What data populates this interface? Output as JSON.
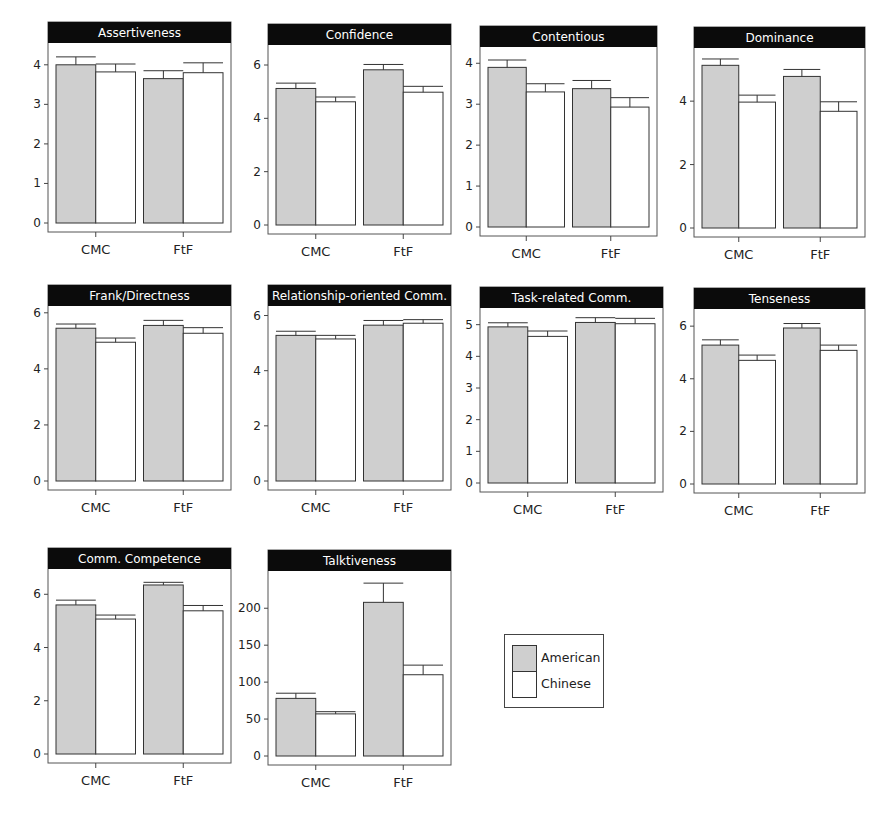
{
  "legend": {
    "items": [
      {
        "label": "American",
        "color": "#cfcfcf"
      },
      {
        "label": "Chinese",
        "color": "#ffffff"
      }
    ]
  },
  "chart_data": [
    {
      "type": "bar",
      "title": "Assertiveness",
      "categories": [
        "CMC",
        "FtF"
      ],
      "yticks": [
        0,
        1,
        2,
        3,
        4
      ],
      "ylim": [
        0,
        4.45
      ],
      "series": [
        {
          "name": "American",
          "values": [
            4.0,
            3.65
          ],
          "errors": [
            0.2,
            0.2
          ]
        },
        {
          "name": "Chinese",
          "values": [
            3.82,
            3.8
          ],
          "errors": [
            0.2,
            0.25
          ]
        }
      ],
      "box": {
        "left": 30,
        "top": 22,
        "width": 202,
        "height": 245
      }
    },
    {
      "type": "bar",
      "title": "Confidence",
      "categories": [
        "CMC",
        "FtF"
      ],
      "yticks": [
        0,
        2,
        4,
        6
      ],
      "ylim": [
        0,
        6.6
      ],
      "series": [
        {
          "name": "American",
          "values": [
            5.12,
            5.82
          ],
          "errors": [
            0.2,
            0.2
          ]
        },
        {
          "name": "Chinese",
          "values": [
            4.62,
            4.98
          ],
          "errors": [
            0.18,
            0.22
          ]
        }
      ],
      "box": {
        "left": 250,
        "top": 24,
        "width": 202,
        "height": 245
      }
    },
    {
      "type": "bar",
      "title": "Contentious",
      "categories": [
        "CMC",
        "FtF"
      ],
      "yticks": [
        0,
        1,
        2,
        3,
        4
      ],
      "ylim": [
        0,
        4.3
      ],
      "series": [
        {
          "name": "American",
          "values": [
            3.9,
            3.38
          ],
          "errors": [
            0.18,
            0.2
          ]
        },
        {
          "name": "Chinese",
          "values": [
            3.3,
            2.93
          ],
          "errors": [
            0.2,
            0.23
          ]
        }
      ],
      "box": {
        "left": 462,
        "top": 26,
        "width": 196,
        "height": 245
      }
    },
    {
      "type": "bar",
      "title": "Dominance",
      "categories": [
        "CMC",
        "FtF"
      ],
      "yticks": [
        0,
        2,
        4
      ],
      "ylim": [
        0,
        5.55
      ],
      "series": [
        {
          "name": "American",
          "values": [
            5.13,
            4.78
          ],
          "errors": [
            0.2,
            0.22
          ]
        },
        {
          "name": "Chinese",
          "values": [
            3.97,
            3.68
          ],
          "errors": [
            0.22,
            0.3
          ]
        }
      ],
      "box": {
        "left": 676,
        "top": 27,
        "width": 190,
        "height": 245
      }
    },
    {
      "type": "bar",
      "title": "Frank/Directness",
      "categories": [
        "CMC",
        "FtF"
      ],
      "yticks": [
        0,
        2,
        4,
        6
      ],
      "ylim": [
        0,
        6.1
      ],
      "series": [
        {
          "name": "American",
          "values": [
            5.45,
            5.55
          ],
          "errors": [
            0.15,
            0.18
          ]
        },
        {
          "name": "Chinese",
          "values": [
            4.95,
            5.27
          ],
          "errors": [
            0.15,
            0.2
          ]
        }
      ],
      "box": {
        "left": 30,
        "top": 285,
        "width": 202,
        "height": 240
      }
    },
    {
      "type": "bar",
      "title": "Relationship-oriented Comm.",
      "categories": [
        "CMC",
        "FtF"
      ],
      "yticks": [
        0,
        2,
        4,
        6
      ],
      "ylim": [
        0,
        6.2
      ],
      "series": [
        {
          "name": "American",
          "values": [
            5.28,
            5.65
          ],
          "errors": [
            0.15,
            0.17
          ]
        },
        {
          "name": "Chinese",
          "values": [
            5.15,
            5.72
          ],
          "errors": [
            0.13,
            0.13
          ]
        }
      ],
      "box": {
        "left": 250,
        "top": 285,
        "width": 202,
        "height": 240
      }
    },
    {
      "type": "bar",
      "title": "Task-related Comm.",
      "categories": [
        "CMC",
        "FtF"
      ],
      "yticks": [
        0,
        1,
        2,
        3,
        4,
        5
      ],
      "ylim": [
        0,
        5.4
      ],
      "series": [
        {
          "name": "American",
          "values": [
            4.93,
            5.07
          ],
          "errors": [
            0.13,
            0.15
          ]
        },
        {
          "name": "Chinese",
          "values": [
            4.63,
            5.03
          ],
          "errors": [
            0.17,
            0.17
          ]
        }
      ],
      "box": {
        "left": 462,
        "top": 287,
        "width": 202,
        "height": 240
      }
    },
    {
      "type": "bar",
      "title": "Tenseness",
      "categories": [
        "CMC",
        "FtF"
      ],
      "yticks": [
        0,
        2,
        4,
        6
      ],
      "ylim": [
        0,
        6.5
      ],
      "series": [
        {
          "name": "American",
          "values": [
            5.28,
            5.93
          ],
          "errors": [
            0.2,
            0.17
          ]
        },
        {
          "name": "Chinese",
          "values": [
            4.7,
            5.08
          ],
          "errors": [
            0.2,
            0.2
          ]
        }
      ],
      "box": {
        "left": 676,
        "top": 288,
        "width": 190,
        "height": 240
      }
    },
    {
      "type": "bar",
      "title": "Comm. Competence",
      "categories": [
        "CMC",
        "FtF"
      ],
      "yticks": [
        0,
        2,
        4,
        6
      ],
      "ylim": [
        0,
        6.8
      ],
      "series": [
        {
          "name": "American",
          "values": [
            5.6,
            6.35
          ],
          "errors": [
            0.18,
            0.1
          ]
        },
        {
          "name": "Chinese",
          "values": [
            5.07,
            5.38
          ],
          "errors": [
            0.15,
            0.2
          ]
        }
      ],
      "box": {
        "left": 30,
        "top": 548,
        "width": 202,
        "height": 250
      }
    },
    {
      "type": "bar",
      "title": "Talktiveness",
      "categories": [
        "CMC",
        "FtF"
      ],
      "yticks": [
        0,
        50,
        100,
        150,
        200
      ],
      "ylim": [
        0,
        245
      ],
      "series": [
        {
          "name": "American",
          "values": [
            78,
            208
          ],
          "errors": [
            7,
            26
          ]
        },
        {
          "name": "Chinese",
          "values": [
            57,
            110
          ],
          "errors": [
            3,
            13
          ]
        }
      ],
      "box": {
        "left": 250,
        "top": 550,
        "width": 202,
        "height": 250
      }
    }
  ]
}
